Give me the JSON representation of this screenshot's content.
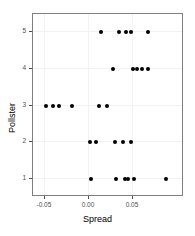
{
  "chart_data": {
    "type": "scatter",
    "title": "",
    "xlabel": "Spread",
    "ylabel": "Pollster",
    "xlim": [
      -0.0636,
      0.108
    ],
    "ylim": [
      0.5,
      5.5
    ],
    "grid": true,
    "legend": null,
    "xticks": [
      -0.05,
      0.0,
      0.05
    ],
    "xticklabels": [
      "-0.05",
      "0.00",
      "0.05"
    ],
    "yticks": [
      1,
      2,
      3,
      4,
      5
    ],
    "yticklabels": [
      "1",
      "2",
      "3",
      "4",
      "5"
    ],
    "point_color": "#000000",
    "points": [
      {
        "x": 0.0136,
        "y": 5
      },
      {
        "x": 0.0341,
        "y": 5
      },
      {
        "x": 0.042,
        "y": 5
      },
      {
        "x": 0.0477,
        "y": 5
      },
      {
        "x": 0.067,
        "y": 5
      },
      {
        "x": 0.0273,
        "y": 4
      },
      {
        "x": 0.05,
        "y": 4
      },
      {
        "x": 0.0545,
        "y": 4
      },
      {
        "x": 0.0602,
        "y": 4
      },
      {
        "x": 0.067,
        "y": 4
      },
      {
        "x": -0.0489,
        "y": 3
      },
      {
        "x": -0.0409,
        "y": 3
      },
      {
        "x": -0.0341,
        "y": 3
      },
      {
        "x": -0.0193,
        "y": 3
      },
      {
        "x": 0.0114,
        "y": 3
      },
      {
        "x": 0.0205,
        "y": 3
      },
      {
        "x": 0.0011,
        "y": 2
      },
      {
        "x": 0.008,
        "y": 2
      },
      {
        "x": 0.0295,
        "y": 2
      },
      {
        "x": 0.0386,
        "y": 2
      },
      {
        "x": 0.0477,
        "y": 2
      },
      {
        "x": 0.0023,
        "y": 1
      },
      {
        "x": 0.0307,
        "y": 1
      },
      {
        "x": 0.0409,
        "y": 1
      },
      {
        "x": 0.0443,
        "y": 1
      },
      {
        "x": 0.0511,
        "y": 1
      },
      {
        "x": 0.0875,
        "y": 1
      }
    ]
  }
}
